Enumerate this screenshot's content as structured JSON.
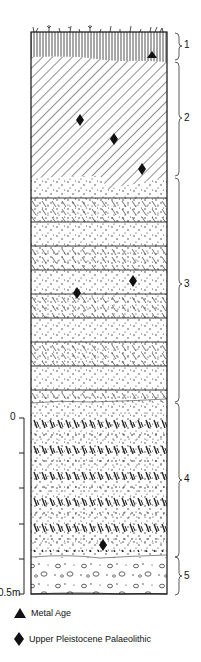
{
  "figure": {
    "type": "stratigraphic-section",
    "layers": [
      {
        "id": "1",
        "label": "1",
        "pattern": "vertical-lines-topsoil",
        "top_px": 32,
        "bottom_px": 60
      },
      {
        "id": "2",
        "label": "2",
        "pattern": "diagonal-hatch",
        "top_px": 60,
        "bottom_px": 177
      },
      {
        "id": "3",
        "label": "3",
        "pattern": "alternating-stipple-and-hatched-bands",
        "top_px": 177,
        "bottom_px": 403
      },
      {
        "id": "4",
        "label": "4",
        "pattern": "stipple-with-dense-dashes",
        "top_px": 403,
        "bottom_px": 556
      },
      {
        "id": "5",
        "label": "5",
        "pattern": "gravel-pebbles",
        "top_px": 556,
        "bottom_px": 594
      }
    ],
    "finds": [
      {
        "type": "Metal Age",
        "symbol": "triangle",
        "x": 152,
        "y": 56,
        "layer": "1"
      },
      {
        "type": "Upper Pleistocene Palaeolithic",
        "symbol": "diamond",
        "x": 80,
        "y": 120,
        "layer": "2"
      },
      {
        "type": "Upper Pleistocene Palaeolithic",
        "symbol": "diamond",
        "x": 114,
        "y": 139,
        "layer": "2"
      },
      {
        "type": "Upper Pleistocene Palaeolithic",
        "symbol": "diamond",
        "x": 142,
        "y": 169,
        "layer": "2"
      },
      {
        "type": "Upper Pleistocene Palaeolithic",
        "symbol": "diamond",
        "x": 133,
        "y": 281,
        "layer": "3"
      },
      {
        "type": "Upper Pleistocene Palaeolithic",
        "symbol": "diamond",
        "x": 77,
        "y": 293,
        "layer": "3"
      },
      {
        "type": "Upper Pleistocene Palaeolithic",
        "symbol": "diamond",
        "x": 103,
        "y": 545,
        "layer": "4"
      }
    ],
    "scale": {
      "top_label": "0",
      "bottom_label": "0.5m",
      "ticks": 5
    }
  },
  "legend": {
    "items": [
      {
        "symbol": "triangle",
        "label": "Metal Age"
      },
      {
        "symbol": "diamond",
        "label": "Upper Pleistocene Palaeolithic"
      }
    ]
  },
  "labels": {
    "scale_top": "0",
    "scale_bottom": "0.5m",
    "l1": "1",
    "l2": "2",
    "l3": "3",
    "l4": "4",
    "l5": "5"
  }
}
